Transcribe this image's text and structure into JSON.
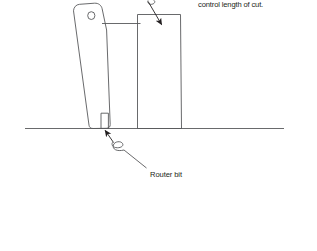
{
  "figure": {
    "kind": "technical-line-drawing",
    "background_color": "#ffffff",
    "line_color": "#58595b",
    "text_color": "#231f20",
    "width": 317,
    "height": 251
  },
  "captions": {
    "top_note": "control length of cut.",
    "router_bit": "Router bit"
  },
  "parts": {
    "router_body_name": "router-body",
    "router_knob_name": "router-knob",
    "router_bit_name": "router-bit",
    "workpiece_name": "workpiece",
    "baseline_name": "work-surface-line",
    "fence_name": "fence-line"
  },
  "leaders": [
    {
      "id": "leader-top",
      "points_to": "workpiece",
      "style": "squiggle-with-arrowhead"
    },
    {
      "id": "leader-router-bit",
      "points_to": "router-bit",
      "style": "squiggle-with-arrowhead"
    }
  ]
}
